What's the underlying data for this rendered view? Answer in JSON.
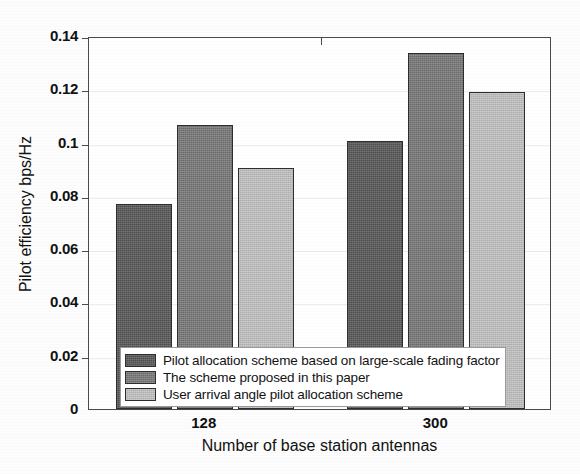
{
  "chart_data": {
    "type": "bar",
    "title": "",
    "xlabel": "Number of base station antennas",
    "ylabel": "Pilot efficiency bps/Hz",
    "categories": [
      "128",
      "300"
    ],
    "ylim": [
      0,
      0.14
    ],
    "yticks": [
      "0",
      "0.02",
      "0.04",
      "0.06",
      "0.08",
      "0.1",
      "0.12",
      "0.14"
    ],
    "ytick_values": [
      0,
      0.02,
      0.04,
      0.06,
      0.08,
      0.1,
      0.12,
      0.14
    ],
    "grid": true,
    "legend_position": "inside-bottom-left",
    "series": [
      {
        "name": "Pilot allocation scheme based on large-scale fading factor",
        "color": "#585858",
        "values": [
          0.077,
          0.1005
        ]
      },
      {
        "name": "The scheme proposed in this paper",
        "color": "#787878",
        "values": [
          0.1065,
          0.1335
        ]
      },
      {
        "name": "User arrival angle pilot allocation scheme",
        "color": "#c2c2c2",
        "values": [
          0.0905,
          0.119
        ]
      }
    ]
  },
  "axis": {
    "frame_color": "#4a4a4a",
    "grid_color": "#ededed"
  }
}
